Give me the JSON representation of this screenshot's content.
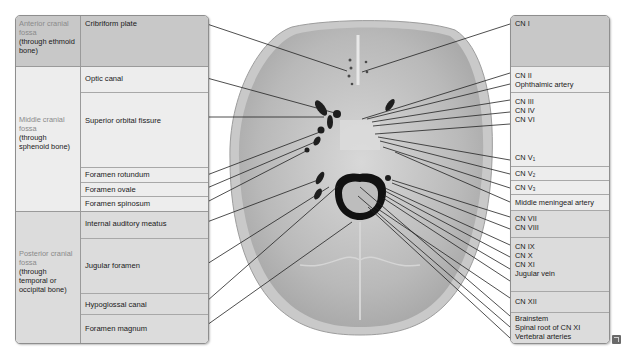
{
  "left_table": {
    "sections": [
      {
        "region_gray": "Anterior cranial fossa",
        "region_sub": "(through ethmoid bone)",
        "rows": [
          "Cribriform plate"
        ]
      },
      {
        "region_gray": "Middle cranial fossa",
        "region_sub": "(through sphenoid bone)",
        "rows": [
          "Optic canal",
          "Superior orbital fissure",
          "Foramen rotundum",
          "Foramen ovale",
          "Foramen spinosum"
        ]
      },
      {
        "region_gray": "Posterior cranial fossa",
        "region_sub": "(through temporal or occipital bone)",
        "rows": [
          "Internal auditory meatus",
          "Jugular foramen",
          "Hypoglossal canal",
          "Foramen magnum"
        ]
      }
    ]
  },
  "right_table": {
    "rows": [
      {
        "items": [
          "CN I"
        ]
      },
      {
        "items": [
          "CN II",
          "Ophthalmic artery"
        ]
      },
      {
        "items": [
          "CN III",
          "CN IV",
          "CN VI",
          "",
          "CN V1"
        ]
      },
      {
        "items": [
          "CN V2"
        ]
      },
      {
        "items": [
          "CN V3"
        ]
      },
      {
        "items": [
          "Middle meningeal artery"
        ]
      },
      {
        "items": [
          "CN VII",
          "CN VIII"
        ]
      },
      {
        "items": [
          "CN IX",
          "CN X",
          "CN XI",
          "Jugular vein"
        ]
      },
      {
        "items": [
          "CN XII"
        ]
      },
      {
        "items": [
          "Brainstem",
          "Spinal root of CN XI",
          "Vertebral arteries"
        ]
      }
    ],
    "cn_v": {
      "prefix": "CN V",
      "sub1": "1",
      "sub2": "2",
      "sub3": "3"
    }
  },
  "illustration": {
    "subject": "Skull base, superior view (internal cranial base)",
    "corner_icon": "expand-icon"
  },
  "colors": {
    "anterior_bg": "#c8c8c8",
    "middle_bg": "#ededed",
    "posterior_bg": "#dcdcdc",
    "border": "#8e8e8e",
    "region_label_gray": "#8a8a8a"
  }
}
